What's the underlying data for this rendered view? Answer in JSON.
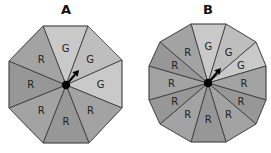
{
  "spinners": [
    {
      "id": "A",
      "title": "A",
      "title_pos": [
        66,
        14
      ],
      "center": [
        66,
        85
      ],
      "vertices": [
        [
          43,
          26
        ],
        [
          88,
          26
        ],
        [
          122,
          60
        ],
        [
          122,
          108
        ],
        [
          89,
          143
        ],
        [
          43,
          143
        ],
        [
          9,
          108
        ],
        [
          9,
          61
        ]
      ],
      "segments": [
        "G",
        "G",
        "G",
        "R",
        "R",
        "R",
        "R",
        "R"
      ],
      "arrow_tip": [
        79,
        70
      ]
    },
    {
      "id": "B",
      "title": "B",
      "title_pos": [
        208,
        14
      ],
      "center": [
        208,
        83
      ],
      "vertices": [
        [
          191,
          24
        ],
        [
          226,
          24
        ],
        [
          256,
          42
        ],
        [
          266,
          66
        ],
        [
          266,
          100
        ],
        [
          256,
          124
        ],
        [
          226,
          142
        ],
        [
          191,
          142
        ],
        [
          160,
          124
        ],
        [
          149,
          100
        ],
        [
          149,
          66
        ],
        [
          160,
          42
        ]
      ],
      "segments": [
        "G",
        "G",
        "G",
        "R",
        "R",
        "R",
        "R",
        "R",
        "R",
        "R",
        "R",
        "R"
      ],
      "arrow_tip": [
        221,
        68
      ]
    }
  ],
  "colors": {
    "G": [
      "#c9c9c9",
      "#bebebe"
    ],
    "R": [
      "#a3a3a3",
      "#979797"
    ],
    "stroke": "#333333",
    "hub": "#000000"
  }
}
